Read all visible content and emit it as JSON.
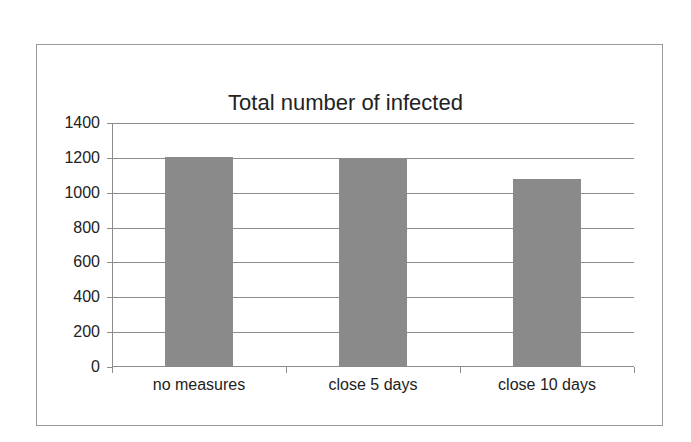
{
  "chart_data": {
    "type": "bar",
    "title": "Total number of infected",
    "categories": [
      "no measures",
      "close 5 days",
      "close 10 days"
    ],
    "values": [
      1205,
      1200,
      1080
    ],
    "xlabel": "",
    "ylabel": "",
    "ylim": [
      0,
      1400
    ],
    "yticks": [
      0,
      200,
      400,
      600,
      800,
      1000,
      1200,
      1400
    ],
    "ytick_labels": [
      "0",
      "200",
      "400",
      "600",
      "800",
      "1000",
      "1200",
      "1400"
    ],
    "grid": true,
    "legend": "none",
    "bar_color": "#8a8a8a"
  }
}
